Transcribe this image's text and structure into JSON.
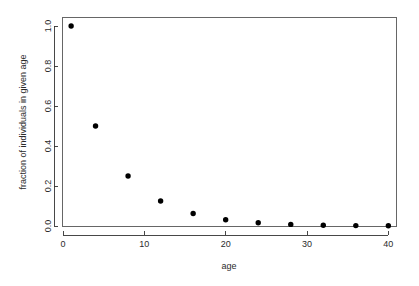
{
  "chart_data": {
    "type": "scatter",
    "title": "",
    "xlabel": "age",
    "ylabel": "fraction of individuals in given age",
    "x": [
      1,
      4,
      8,
      12,
      16,
      20,
      24,
      28,
      32,
      36,
      40
    ],
    "values": [
      1.0,
      0.5,
      0.25,
      0.125,
      0.0625,
      0.031,
      0.016,
      0.008,
      0.004,
      0.002,
      0.001
    ],
    "xlim": [
      0,
      41
    ],
    "ylim": [
      0,
      1.04
    ],
    "xticks": [
      0,
      10,
      20,
      30,
      40
    ],
    "xtick_labels": [
      "0",
      "10",
      "20",
      "30",
      "40"
    ],
    "yticks": [
      0.0,
      0.2,
      0.4,
      0.6,
      0.8,
      1.0
    ],
    "ytick_labels": [
      "0.0",
      "0.2",
      "0.4",
      "0.6",
      "0.8",
      "1.0"
    ],
    "grid": false,
    "legend": null,
    "marker": "filled-circle",
    "marker_color": "#000000",
    "frame": true,
    "ytick_label_rotation": 90,
    "ylabel_rotation": 90
  }
}
